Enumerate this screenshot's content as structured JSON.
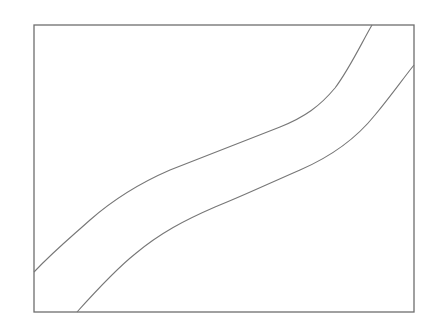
{
  "figure": {
    "frame": {
      "x": 34,
      "y": 25,
      "width": 380,
      "height": 287,
      "stroke": "#6e6e6e"
    },
    "curves": [
      {
        "name": "upper-curve",
        "stroke": "#777777",
        "path": "M34,272 C55,250 70,238 90,220 C115,198 140,183 170,170 C200,158 240,143 280,127 C305,117 320,106 335,88 C350,68 362,42 372,25"
      },
      {
        "name": "lower-curve",
        "stroke": "#777777",
        "path": "M77,312 C95,292 115,270 135,254 C160,233 185,220 215,207 C245,195 270,183 300,170 C330,157 355,140 375,115 C390,97 402,80 414,65"
      }
    ]
  }
}
